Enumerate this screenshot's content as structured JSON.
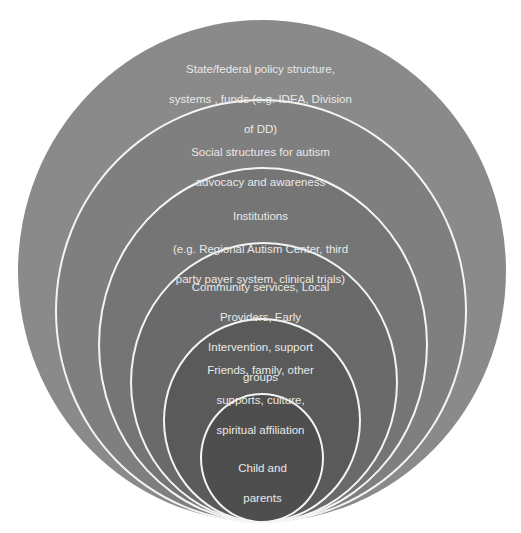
{
  "diagram": {
    "type": "nested-circles",
    "title": "",
    "layers": [
      {
        "id": "policy",
        "lines": [
          "State/federal policy structure,",
          "systems , funds (e.g. IDEA, Division",
          "of DD)"
        ],
        "fill": "#8a8a8a"
      },
      {
        "id": "social",
        "lines": [
          "Social structures for autism",
          "advocacy and awareness"
        ],
        "fill": "#7f7f7f"
      },
      {
        "id": "institutions",
        "lines": [
          "Institutions",
          "(e.g. Regional Autism Center, third",
          "party payer system, clinical trials)"
        ],
        "fill": "#757575"
      },
      {
        "id": "community",
        "lines": [
          "Community services, Local",
          "Providers, Early",
          "Intervention, support",
          "groups"
        ],
        "fill": "#6a6a6a"
      },
      {
        "id": "friends",
        "lines": [
          "Friends, family, other",
          "supports, culture,",
          "spiritual affiliation"
        ],
        "fill": "#5a5a5a"
      },
      {
        "id": "child",
        "lines": [
          "Child and",
          "parents"
        ],
        "fill": "#4e4e4e"
      }
    ],
    "ring_border_color": "#f4f4f4",
    "background": "#ffffff"
  }
}
